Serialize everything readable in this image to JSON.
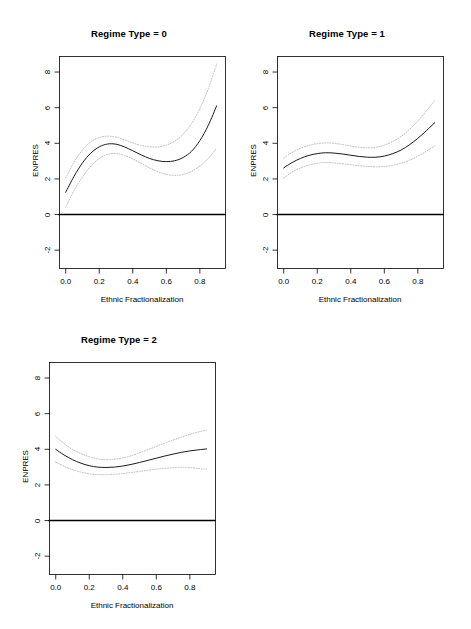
{
  "figure": {
    "background": "#ffffff",
    "panel_count": 3,
    "axis_color": "#000000",
    "fit_line_color": "#1a1a1a",
    "ci_line_color": "#b5b5b5",
    "reference_line_color": "#000000"
  },
  "chart_data": [
    {
      "type": "line",
      "title": "Regime Type = 0",
      "xlabel": "Ethnic Fractionalization",
      "ylabel": "ENPRES",
      "xlim": [
        -0.04,
        0.95
      ],
      "ylim": [
        -3.0,
        8.9
      ],
      "xticks": [
        0.0,
        0.2,
        0.4,
        0.6,
        0.8
      ],
      "xticklabels": [
        "0.0",
        "0.2",
        "0.4",
        "0.6",
        "0.8"
      ],
      "yticks": [
        -2,
        0,
        2,
        4,
        6,
        8
      ],
      "yticklabels": [
        "-2",
        "0",
        "2",
        "4",
        "6",
        "8"
      ],
      "grid": false,
      "legend": null,
      "series": [
        {
          "name": "fit",
          "style": "solid",
          "x": [
            0.0,
            0.05,
            0.1,
            0.15,
            0.2,
            0.25,
            0.3,
            0.35,
            0.4,
            0.45,
            0.5,
            0.55,
            0.6,
            0.65,
            0.7,
            0.75,
            0.8,
            0.85,
            0.9
          ],
          "values": [
            1.25,
            2.15,
            2.9,
            3.45,
            3.8,
            3.96,
            3.95,
            3.8,
            3.58,
            3.35,
            3.15,
            3.02,
            2.97,
            3.02,
            3.2,
            3.55,
            4.15,
            5.0,
            6.1
          ]
        },
        {
          "name": "upper-ci",
          "style": "dotted",
          "x": [
            0.0,
            0.05,
            0.1,
            0.15,
            0.2,
            0.25,
            0.3,
            0.35,
            0.4,
            0.45,
            0.5,
            0.55,
            0.6,
            0.65,
            0.7,
            0.75,
            0.8,
            0.85,
            0.9
          ],
          "values": [
            2.05,
            2.95,
            3.62,
            4.08,
            4.32,
            4.4,
            4.35,
            4.2,
            4.02,
            3.88,
            3.8,
            3.8,
            3.9,
            4.12,
            4.5,
            5.1,
            5.95,
            7.05,
            8.45
          ]
        },
        {
          "name": "lower-ci",
          "style": "dotted",
          "x": [
            0.0,
            0.05,
            0.1,
            0.15,
            0.2,
            0.25,
            0.3,
            0.35,
            0.4,
            0.45,
            0.5,
            0.55,
            0.6,
            0.65,
            0.7,
            0.75,
            0.8,
            0.85,
            0.9
          ],
          "values": [
            0.42,
            1.35,
            2.1,
            2.72,
            3.15,
            3.38,
            3.42,
            3.32,
            3.12,
            2.88,
            2.62,
            2.4,
            2.25,
            2.2,
            2.25,
            2.42,
            2.72,
            3.15,
            3.72
          ]
        },
        {
          "name": "zero-reference",
          "style": "solid-thick",
          "x": [
            -0.04,
            0.95
          ],
          "values": [
            0,
            0
          ]
        }
      ]
    },
    {
      "type": "line",
      "title": "Regime Type = 1",
      "xlabel": "Ethnic Fractionalization",
      "ylabel": "ENPRES",
      "xlim": [
        -0.04,
        0.95
      ],
      "ylim": [
        -3.0,
        8.9
      ],
      "xticks": [
        0.0,
        0.2,
        0.4,
        0.6,
        0.8
      ],
      "xticklabels": [
        "0.0",
        "0.2",
        "0.4",
        "0.6",
        "0.8"
      ],
      "yticks": [
        -2,
        0,
        2,
        4,
        6,
        8
      ],
      "yticklabels": [
        "-2",
        "0",
        "2",
        "4",
        "6",
        "8"
      ],
      "grid": false,
      "legend": null,
      "series": [
        {
          "name": "fit",
          "style": "solid",
          "x": [
            0.0,
            0.05,
            0.1,
            0.15,
            0.2,
            0.25,
            0.3,
            0.35,
            0.4,
            0.45,
            0.5,
            0.55,
            0.6,
            0.65,
            0.7,
            0.75,
            0.8,
            0.85,
            0.9
          ],
          "values": [
            2.62,
            2.92,
            3.15,
            3.32,
            3.42,
            3.47,
            3.45,
            3.4,
            3.33,
            3.26,
            3.22,
            3.22,
            3.28,
            3.42,
            3.62,
            3.92,
            4.28,
            4.7,
            5.15
          ]
        },
        {
          "name": "upper-ci",
          "style": "dotted",
          "x": [
            0.0,
            0.05,
            0.1,
            0.15,
            0.2,
            0.25,
            0.3,
            0.35,
            0.4,
            0.45,
            0.5,
            0.55,
            0.6,
            0.65,
            0.7,
            0.75,
            0.8,
            0.85,
            0.9
          ],
          "values": [
            3.18,
            3.48,
            3.72,
            3.88,
            3.98,
            4.02,
            4.0,
            3.93,
            3.85,
            3.78,
            3.75,
            3.78,
            3.9,
            4.1,
            4.38,
            4.78,
            5.25,
            5.8,
            6.4
          ]
        },
        {
          "name": "lower-ci",
          "style": "dotted",
          "x": [
            0.0,
            0.05,
            0.1,
            0.15,
            0.2,
            0.25,
            0.3,
            0.35,
            0.4,
            0.45,
            0.5,
            0.55,
            0.6,
            0.65,
            0.7,
            0.75,
            0.8,
            0.85,
            0.9
          ],
          "values": [
            2.05,
            2.38,
            2.62,
            2.78,
            2.88,
            2.92,
            2.9,
            2.85,
            2.8,
            2.74,
            2.7,
            2.68,
            2.7,
            2.76,
            2.88,
            3.05,
            3.28,
            3.55,
            3.85
          ]
        },
        {
          "name": "zero-reference",
          "style": "solid-thick",
          "x": [
            -0.04,
            0.95
          ],
          "values": [
            0,
            0
          ]
        }
      ]
    },
    {
      "type": "line",
      "title": "Regime Type = 2",
      "xlabel": "Ethnic Fractionalization",
      "ylabel": "ENPRES",
      "xlim": [
        -0.04,
        0.95
      ],
      "ylim": [
        -3.0,
        8.9
      ],
      "xticks": [
        0.0,
        0.2,
        0.4,
        0.6,
        0.8
      ],
      "xticklabels": [
        "0.0",
        "0.2",
        "0.4",
        "0.6",
        "0.8"
      ],
      "yticks": [
        -2,
        0,
        2,
        4,
        6,
        8
      ],
      "yticklabels": [
        "-2",
        "0",
        "2",
        "4",
        "6",
        "8"
      ],
      "grid": false,
      "legend": null,
      "series": [
        {
          "name": "fit",
          "style": "solid",
          "x": [
            0.0,
            0.05,
            0.1,
            0.15,
            0.2,
            0.25,
            0.3,
            0.35,
            0.4,
            0.45,
            0.5,
            0.55,
            0.6,
            0.65,
            0.7,
            0.75,
            0.8,
            0.85,
            0.9
          ],
          "values": [
            4.0,
            3.68,
            3.42,
            3.22,
            3.08,
            3.0,
            2.98,
            3.0,
            3.06,
            3.15,
            3.26,
            3.38,
            3.5,
            3.62,
            3.73,
            3.83,
            3.91,
            3.97,
            4.02
          ]
        },
        {
          "name": "upper-ci",
          "style": "dotted",
          "x": [
            0.0,
            0.05,
            0.1,
            0.15,
            0.2,
            0.25,
            0.3,
            0.35,
            0.4,
            0.45,
            0.5,
            0.55,
            0.6,
            0.65,
            0.7,
            0.75,
            0.8,
            0.85,
            0.9
          ],
          "values": [
            4.72,
            4.32,
            4.0,
            3.76,
            3.58,
            3.46,
            3.42,
            3.44,
            3.52,
            3.64,
            3.8,
            3.98,
            4.16,
            4.35,
            4.52,
            4.68,
            4.84,
            4.97,
            5.08
          ]
        },
        {
          "name": "lower-ci",
          "style": "dotted",
          "x": [
            0.0,
            0.05,
            0.1,
            0.15,
            0.2,
            0.25,
            0.3,
            0.35,
            0.4,
            0.45,
            0.5,
            0.55,
            0.6,
            0.65,
            0.7,
            0.75,
            0.8,
            0.85,
            0.9
          ],
          "values": [
            3.28,
            3.05,
            2.86,
            2.72,
            2.62,
            2.58,
            2.58,
            2.6,
            2.64,
            2.7,
            2.76,
            2.82,
            2.88,
            2.93,
            2.97,
            2.99,
            2.97,
            2.92,
            2.88
          ]
        },
        {
          "name": "zero-reference",
          "style": "solid-thick",
          "x": [
            -0.04,
            0.95
          ],
          "values": [
            0,
            0
          ]
        }
      ]
    }
  ],
  "panels": [
    {
      "index": 0,
      "left": 18,
      "top": 22,
      "width": 222,
      "height": 300
    },
    {
      "index": 1,
      "left": 236,
      "top": 22,
      "width": 222,
      "height": 300
    },
    {
      "index": 2,
      "left": 8,
      "top": 328,
      "width": 222,
      "height": 300
    }
  ]
}
